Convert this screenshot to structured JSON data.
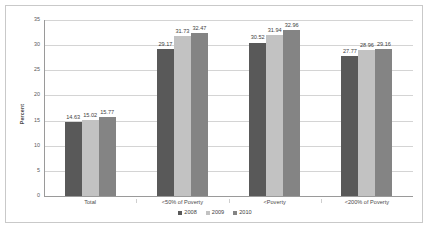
{
  "chart_data": {
    "type": "bar",
    "title": "",
    "xlabel": "",
    "ylabel": "Percent",
    "ylim": [
      0,
      35
    ],
    "ytick_step": 5,
    "yticks": [
      0,
      5,
      10,
      15,
      20,
      25,
      30,
      35
    ],
    "grid": true,
    "legend_position": "bottom",
    "categories": [
      "Total",
      "<50% of Poverty",
      "<Poverty",
      "<200% of Poverty"
    ],
    "series": [
      {
        "name": "2008",
        "color": "#595959",
        "values": [
          14.63,
          29.17,
          30.52,
          27.77
        ]
      },
      {
        "name": "2009",
        "color": "#c2c2c2",
        "values": [
          15.02,
          31.73,
          31.94,
          28.96
        ]
      },
      {
        "name": "2010",
        "color": "#848484",
        "values": [
          15.77,
          32.47,
          32.96,
          29.16
        ]
      }
    ]
  }
}
